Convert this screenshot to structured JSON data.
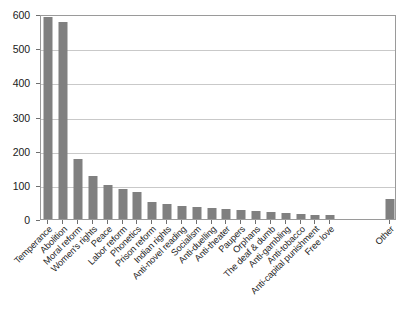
{
  "chart_data": {
    "type": "bar",
    "title": "",
    "subtitle": "",
    "xlabel": "",
    "ylabel": "",
    "ylim": [
      0,
      600
    ],
    "y_ticks": [
      0,
      100,
      200,
      300,
      400,
      500,
      600
    ],
    "grid": true,
    "legend": "none",
    "orientation": "vertical",
    "bar_color": "#808080",
    "categories": [
      "Temperance",
      "Abolition",
      "Moral reform",
      "Women's rights",
      "Peace",
      "Labor reform",
      "Phonetics",
      "Prison reform",
      "Indian rights",
      "Anti-novel reading",
      "Socialism",
      "Anti-duelling",
      "Anti-theater",
      "Paupers",
      "Orphans",
      "The deaf & dumb",
      "Anti-gambling",
      "Anti-tobacco",
      "Anti-capital punishment",
      "Free love",
      "Other"
    ],
    "values": [
      592,
      578,
      175,
      125,
      100,
      88,
      80,
      50,
      45,
      38,
      35,
      32,
      30,
      27,
      22,
      20,
      18,
      15,
      13,
      12,
      60
    ],
    "gap_before_last_category": true
  }
}
